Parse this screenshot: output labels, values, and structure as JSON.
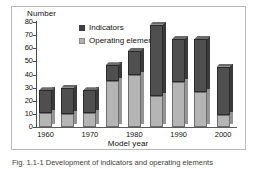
{
  "chart_data": {
    "type": "bar",
    "subtype": "stacked-3d-column",
    "title": "",
    "xlabel": "Model year",
    "ylabel": "Number",
    "ylim": [
      0,
      80
    ],
    "yticks": [
      0,
      10,
      20,
      30,
      40,
      50,
      60,
      70,
      80
    ],
    "grid": false,
    "legend_position": "top-left-inside",
    "categories": [
      "1960",
      "1965",
      "1970",
      "1975",
      "1980",
      "1985",
      "1990",
      "1995",
      "2000"
    ],
    "xtick_labels": [
      "1960",
      "1970",
      "1980",
      "1990",
      "2000"
    ],
    "series": [
      {
        "name": "Operating elements",
        "color": "#b5b5b5",
        "values": [
          11,
          10,
          11,
          35,
          40,
          24,
          34,
          27,
          9
        ]
      },
      {
        "name": "Indicators",
        "color": "#4f4f4f",
        "values": [
          17,
          20,
          17,
          12,
          18,
          54,
          33,
          40,
          37
        ]
      }
    ],
    "totals": [
      28,
      30,
      28,
      47,
      58,
      78,
      67,
      67,
      46
    ]
  },
  "axes": {
    "y_title": "Number",
    "x_title": "Model year"
  },
  "legend": {
    "items": [
      {
        "label": "Indicators",
        "swatch": "dark-square-icon"
      },
      {
        "label": "Operating elements",
        "swatch": "light-square-icon"
      }
    ]
  },
  "caption": {
    "text": "Fig. 1.1-1 Development of indicators and operating elements"
  }
}
